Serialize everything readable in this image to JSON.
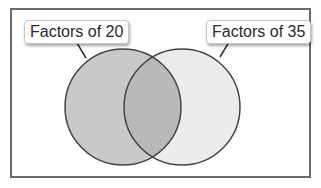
{
  "diagram": {
    "type": "venn",
    "sets": [
      {
        "id": "left",
        "label": "Factors of 20",
        "fill": "#c9c9c9"
      },
      {
        "id": "right",
        "label": "Factors of 35",
        "fill": "#ececec"
      }
    ],
    "intersection_fill": "#b9b9b9",
    "outline_color": "#444444",
    "frame_border_color": "#6b6b6b"
  }
}
